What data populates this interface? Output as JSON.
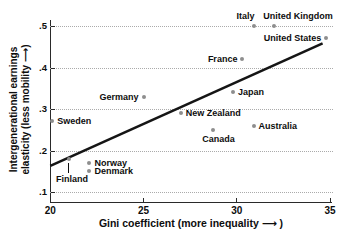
{
  "figure": {
    "background": "#ffffff",
    "text_color": "#0d0d0d",
    "axis_color": "#2a2a2a",
    "grid_color": "#ababab",
    "marker_color": "#8e8e8e",
    "trend_color": "#151515"
  },
  "chart_data": {
    "type": "scatter",
    "title": "",
    "xlabel": "Gini coefficient (more inequality ⟶ )",
    "ylabel_line1": "Intergenerational earnings",
    "ylabel_line2": "elasticity (less mobility ⟶)",
    "xlim": [
      20,
      35
    ],
    "ylim": [
      0.1,
      0.5
    ],
    "grid": true,
    "legend": false,
    "x_ticks": [
      "20",
      "25",
      "30",
      "35"
    ],
    "y_ticks": [
      ".1",
      ".2",
      ".3",
      ".4",
      ".5"
    ],
    "points": [
      {
        "label": "Sweden",
        "x": 20.1,
        "y": 0.27,
        "side": "right"
      },
      {
        "label": "Finland",
        "x": 21.0,
        "y": 0.18,
        "side": "leader-below",
        "dx": 3
      },
      {
        "label": "Norway",
        "x": 22.1,
        "y": 0.17,
        "side": "right"
      },
      {
        "label": "Denmark",
        "x": 22.1,
        "y": 0.15,
        "side": "right"
      },
      {
        "label": "Germany",
        "x": 25.0,
        "y": 0.33,
        "side": "left"
      },
      {
        "label": "New Zealand",
        "x": 27.0,
        "y": 0.29,
        "side": "right"
      },
      {
        "label": "Canada",
        "x": 28.7,
        "y": 0.25,
        "side": "below",
        "dx": 6
      },
      {
        "label": "Japan",
        "x": 29.8,
        "y": 0.34,
        "side": "right"
      },
      {
        "label": "France",
        "x": 30.3,
        "y": 0.42,
        "side": "left"
      },
      {
        "label": "Australia",
        "x": 30.9,
        "y": 0.26,
        "side": "right"
      },
      {
        "label": "Italy",
        "x": 30.9,
        "y": 0.5,
        "side": "above",
        "dx": -8
      },
      {
        "label": "United Kingdom",
        "x": 32.0,
        "y": 0.5,
        "side": "above",
        "dx": 24
      },
      {
        "label": "United States",
        "x": 34.8,
        "y": 0.47,
        "side": "left"
      }
    ],
    "trend_line": {
      "x1": 20.0,
      "y1": 0.163,
      "x2": 34.6,
      "y2": 0.458
    }
  }
}
